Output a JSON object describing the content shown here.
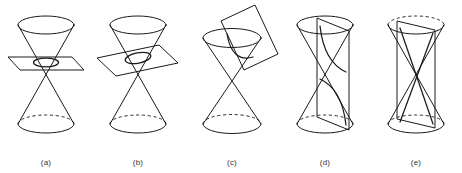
{
  "figure": {
    "background_color": "#ffffff",
    "ink_color": "#1a1a1a",
    "panels": [
      {
        "id": "panel-a",
        "caption": "(a)",
        "conic_name": "circle",
        "plane_orientation": "horizontal",
        "cuts_nappes": "upper only",
        "cross_section_shape": "circle",
        "left": 0,
        "width": 92
      },
      {
        "id": "panel-b",
        "caption": "(b)",
        "conic_name": "ellipse",
        "plane_orientation": "tilted",
        "cuts_nappes": "upper only",
        "cross_section_shape": "ellipse",
        "left": 92,
        "width": 92
      },
      {
        "id": "panel-c",
        "caption": "(c)",
        "conic_name": "parabola",
        "plane_orientation": "parallel to a generator",
        "cuts_nappes": "upper only",
        "cross_section_shape": "parabola",
        "left": 184,
        "width": 96
      },
      {
        "id": "panel-d",
        "caption": "(d)",
        "conic_name": "hyperbola",
        "plane_orientation": "vertical",
        "cuts_nappes": "both nappes",
        "cross_section_shape": "hyperbola",
        "left": 280,
        "width": 90
      },
      {
        "id": "panel-e",
        "caption": "(e)",
        "conic_name": "intersecting lines",
        "plane_orientation": "vertical through vertex",
        "cuts_nappes": "both nappes through vertex",
        "cross_section_shape": "two intersecting lines",
        "left": 370,
        "width": 92
      }
    ]
  }
}
